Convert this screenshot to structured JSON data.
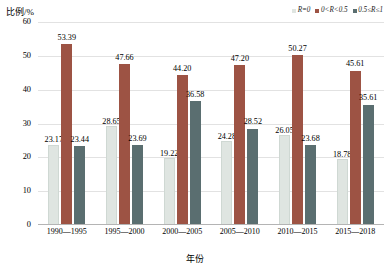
{
  "chart_data": {
    "type": "bar",
    "title": "",
    "xlabel": "年份",
    "ylabel": "比例/%",
    "ylim": [
      0,
      60
    ],
    "yticks": [
      0,
      10,
      20,
      30,
      40,
      50,
      60
    ],
    "grid": true,
    "legend_position": "top-right",
    "categories": [
      "1990—1995",
      "1995—2000",
      "2000—2005",
      "2005—2010",
      "2010—2015",
      "2015—2018"
    ],
    "series": [
      {
        "name": "R=0",
        "color": "#dfe5e1",
        "values": [
          23.17,
          28.65,
          19.22,
          24.28,
          26.05,
          18.78
        ],
        "labels": [
          "23.17",
          "28.65",
          "19.22",
          "24.28",
          "26.05",
          "18.78"
        ]
      },
      {
        "name": "0<R<0.5",
        "color": "#9d5344",
        "values": [
          53.39,
          47.66,
          44.2,
          47.2,
          50.27,
          45.61
        ],
        "labels": [
          "53.39",
          "47.66",
          "44.20",
          "47.20",
          "50.27",
          "45.61"
        ]
      },
      {
        "name": "0.5≤R≤1",
        "color": "#5a6e70",
        "values": [
          23.44,
          23.69,
          36.58,
          28.52,
          23.68,
          35.61
        ],
        "labels": [
          "23.44",
          "23.69",
          "36.58",
          "28.52",
          "23.68",
          "35.61"
        ]
      }
    ]
  }
}
